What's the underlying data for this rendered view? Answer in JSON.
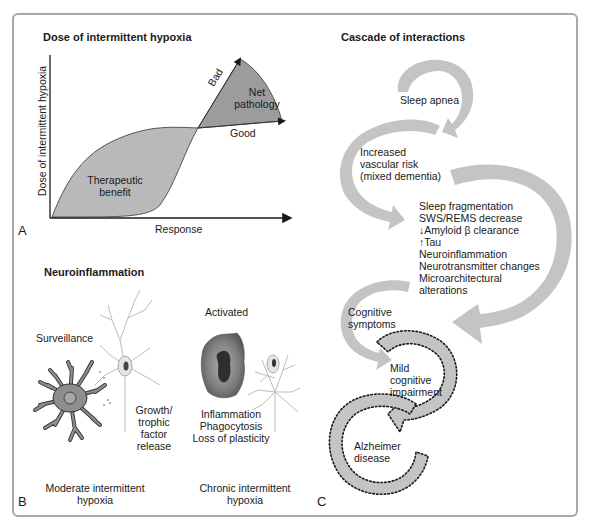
{
  "panel_a": {
    "letter": "A",
    "title": "Dose of intermittent hypoxia",
    "y_axis_label": "Dose of intermittent hypoxia",
    "x_axis_label": "Response",
    "region_benefit": [
      "Therapeutic",
      "benefit"
    ],
    "region_pathology": [
      "Net",
      "pathology"
    ],
    "curve_bad": "Bad",
    "curve_good": "Good"
  },
  "panel_b": {
    "letter": "B",
    "title": "Neuroinflammation",
    "state_left": "Surveillance",
    "state_right": "Activated",
    "effect_left": [
      "Growth/",
      "trophic",
      "factor",
      "release"
    ],
    "effect_right": [
      "Inflammation",
      "Phagocytosis",
      "Loss of plasticity"
    ],
    "condition_left": [
      "Moderate intermittent",
      "hypoxia"
    ],
    "condition_right": [
      "Chronic intermittent",
      "hypoxia"
    ]
  },
  "panel_c": {
    "letter": "C",
    "title": "Cascade of interactions",
    "step_1": "Sleep apnea",
    "step_2": [
      "Increased",
      "vascular risk",
      "(mixed dementia)"
    ],
    "step_3": [
      "Sleep fragmentation",
      "SWS/REMS decrease",
      "↓Amyloid β clearance",
      "↑Tau",
      "Neuroinflammation",
      "Neurotransmitter changes",
      "Microarchitectural",
      "alterations"
    ],
    "step_4": [
      "Cognitive",
      "symptoms"
    ],
    "step_5": [
      "Mild",
      "cognitive",
      "impairment"
    ],
    "step_6": [
      "Alzheimer",
      "disease"
    ]
  },
  "colors": {
    "border": "#a8a8a8",
    "region_fill": "#b9b9b9",
    "pathology_fill": "#9c9c9c",
    "arrow_fill": "#c4c4c4",
    "microglia_fill": "#8e8e8e",
    "neuron_stroke": "#bdbdbd"
  }
}
